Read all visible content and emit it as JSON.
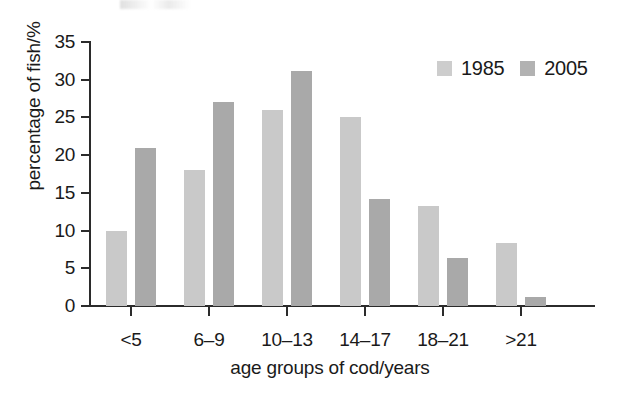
{
  "chart_data": {
    "type": "bar",
    "title": "",
    "subtitle": "",
    "xlabel": "age groups of cod/years",
    "ylabel": "percentage of fish/%",
    "categories": [
      "<5",
      "6–9",
      "10–13",
      "14–17",
      "18–21",
      ">21"
    ],
    "series": [
      {
        "name": "1985",
        "color": "#c9c9c9",
        "values": [
          10,
          18,
          26,
          25,
          13.3,
          8.3
        ]
      },
      {
        "name": "2005",
        "color": "#a9a9a9",
        "values": [
          21,
          27,
          31.2,
          14.2,
          6.3,
          1.2
        ]
      }
    ],
    "ylim": [
      0,
      35
    ],
    "yticks": [
      0,
      5,
      10,
      15,
      20,
      25,
      30,
      35
    ],
    "ytick_labels": [
      "0",
      "5",
      "10",
      "15",
      "20",
      "25",
      "30",
      "35"
    ],
    "grid": false,
    "legend_position": "top-right",
    "legend_entries": [
      "1985",
      "2005"
    ],
    "annotations": []
  },
  "legend": {
    "items": [
      {
        "label": "1985",
        "swatch": "legend-swatch-1985"
      },
      {
        "label": "2005",
        "swatch": "legend-swatch-2005"
      }
    ]
  }
}
